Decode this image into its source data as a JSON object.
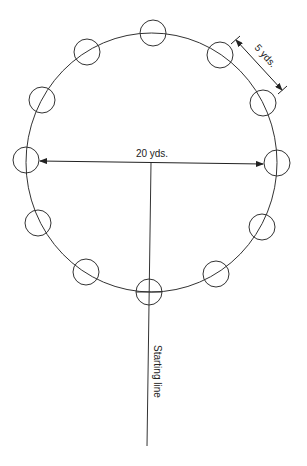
{
  "diagram": {
    "type": "field-layout",
    "labels": {
      "diameter": "20 yds.",
      "spacing": "5 yds.",
      "start": "Starting line"
    },
    "station_count": 12,
    "colors": {
      "stroke": "#333333",
      "background": "#ffffff"
    }
  }
}
